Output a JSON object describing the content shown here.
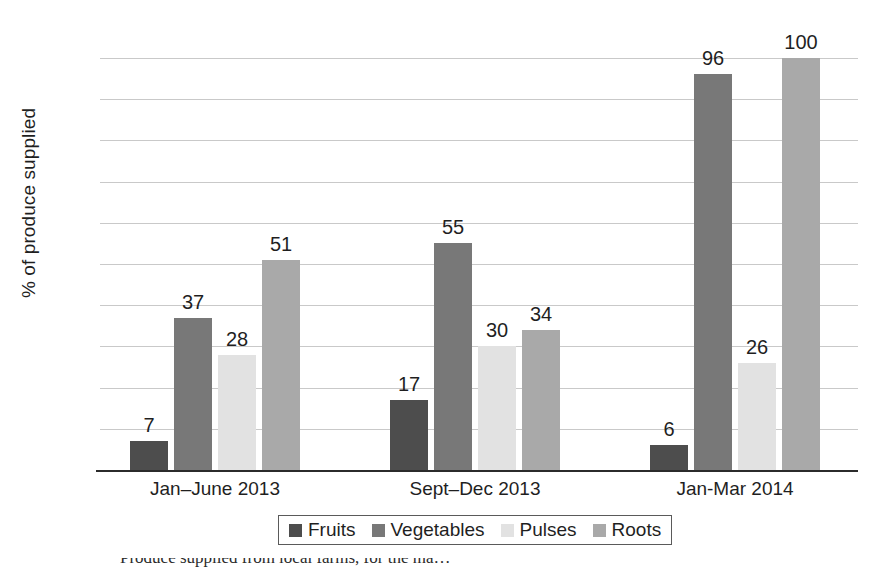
{
  "chart_data": {
    "type": "bar",
    "title": "",
    "xlabel": "",
    "ylabel": "% of produce supplied",
    "ylim": [
      0,
      100
    ],
    "ytick_labels": [
      "100",
      "90",
      "80",
      "70",
      "60",
      "50",
      "40",
      "30",
      "20",
      "10",
      "0"
    ],
    "ytick_values": [
      100,
      90,
      80,
      70,
      60,
      50,
      40,
      30,
      20,
      10,
      0
    ],
    "grid": true,
    "legend_position": "bottom",
    "categories": [
      "Jan–June 2013",
      "Sept–Dec 2013",
      "Jan-Mar 2014"
    ],
    "series": [
      {
        "name": "Fruits",
        "color": "#4d4d4d",
        "values": [
          7,
          17,
          6
        ]
      },
      {
        "name": "Vegetables",
        "color": "#787878",
        "values": [
          37,
          55,
          96
        ]
      },
      {
        "name": "Pulses",
        "color": "#e2e2e2",
        "values": [
          28,
          30,
          26
        ]
      },
      {
        "name": "Roots",
        "color": "#a9a9a9",
        "values": [
          51,
          34,
          100
        ]
      }
    ],
    "value_labels": [
      [
        "7",
        "37",
        "28",
        "51"
      ],
      [
        "17",
        "55",
        "30",
        "34"
      ],
      [
        "6",
        "96",
        "26",
        "100"
      ]
    ]
  },
  "legend": {
    "items": [
      {
        "label": "Fruits",
        "swatch_color": "#4d4d4d",
        "icon": "legend-swatch-icon"
      },
      {
        "label": "Vegetables",
        "swatch_color": "#787878",
        "icon": "legend-swatch-icon"
      },
      {
        "label": "Pulses",
        "swatch_color": "#e2e2e2",
        "icon": "legend-swatch-icon"
      },
      {
        "label": "Roots",
        "swatch_color": "#a9a9a9",
        "icon": "legend-swatch-icon"
      }
    ]
  },
  "caption": {
    "text": "Produce supplied from local farms, for the ma…"
  },
  "colors": {
    "gridline": "#c9c9c9",
    "axis": "#2b2b2b",
    "text": "#1f1f1f",
    "background": "#ffffff"
  }
}
